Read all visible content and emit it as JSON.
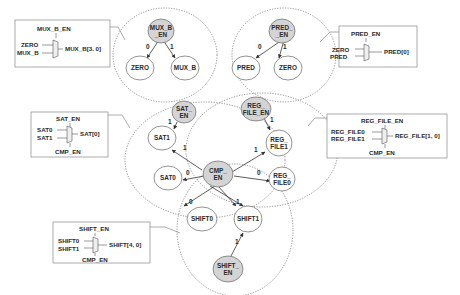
{
  "colors": {
    "enable_node_fill": "#d4d4d4",
    "plain_node_fill": "#ffffff",
    "stroke": "#555555",
    "cluster_stroke": "#777777",
    "text": "#2a2a2a"
  },
  "mux_boxes": {
    "mux_b": {
      "title": "MUX_B_EN",
      "in0": "ZERO",
      "in1": "MUX_B",
      "out": "MUX_B[3. 0]",
      "bottom": ""
    },
    "pred": {
      "title": "PRED_EN",
      "in0": "ZERO",
      "in1": "PRED",
      "out": "PRED[0]",
      "bottom": ""
    },
    "sat": {
      "title": "SAT_EN",
      "in0": "SAT0",
      "in1": "SAT1",
      "out": "SAT[0]",
      "bottom": "CMP_EN"
    },
    "reg_file": {
      "title": "REG_FILE_EN",
      "in0": "REG_FILE0",
      "in1": "REG_FILE1",
      "out": "REG_FILE[1, 0]",
      "bottom": "CMP_EN"
    },
    "shift": {
      "title": "SHIFT_EN",
      "in0": "SHIFT0",
      "in1": "SHIFT1",
      "out": "SHIFT[4, 0]",
      "bottom": "CMP_EN"
    }
  },
  "nodes": {
    "mux_b_en": {
      "l1": "MUX_B",
      "l2": "_EN"
    },
    "zero_a": {
      "l1": "ZERO"
    },
    "mux_b": {
      "l1": "MUX_B"
    },
    "pred_en": {
      "l1": "PRED_",
      "l2": "_EN"
    },
    "pred": {
      "l1": "PRED"
    },
    "zero_b": {
      "l1": "ZERO"
    },
    "sat_en": {
      "l1": "SAT_",
      "l2": "EN"
    },
    "sat1": {
      "l1": "SAT1"
    },
    "sat0": {
      "l1": "SAT0"
    },
    "reg_file_en": {
      "l1": "REG_",
      "l2": "FILE_EN"
    },
    "reg_file1": {
      "l1": "REG_",
      "l2": "FILE1"
    },
    "reg_file0": {
      "l1": "REG_",
      "l2": "FILE0"
    },
    "cmp_en": {
      "l1": "CMP_",
      "l2": "EN"
    },
    "shift0": {
      "l1": "SHIFT0"
    },
    "shift1": {
      "l1": "SHIFT1"
    },
    "shift_en": {
      "l1": "SHIFT_",
      "l2": "EN"
    }
  },
  "edge_labels": {
    "mux_b_0": "0",
    "mux_b_1": "1",
    "pred_0": "0",
    "pred_1": "1",
    "sat_en_1": "1",
    "cmp_sat1": "1",
    "cmp_sat0": "0",
    "reg_en_1": "1",
    "cmp_reg1": "1",
    "cmp_reg0": "0",
    "cmp_shift0": "0",
    "cmp_shift1": "1",
    "shift_en_1": "1"
  }
}
